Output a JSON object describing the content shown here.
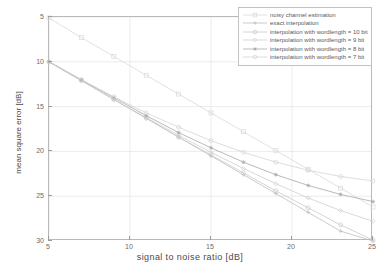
{
  "chart_data": {
    "type": "line",
    "title": "",
    "xlabel": "signal  to  noise ratio [dB]",
    "ylabel": "mean square error [dB]",
    "xlim": [
      5,
      25
    ],
    "ylim": [
      5,
      30
    ],
    "y_inverted": true,
    "grid": true,
    "legend_position": "top-right",
    "xticks": [
      5,
      10,
      15,
      20,
      25
    ],
    "yticks": [
      5,
      10,
      15,
      20,
      25,
      30
    ],
    "x": [
      5,
      7,
      9,
      11,
      13,
      15,
      17,
      19,
      21,
      23,
      25
    ],
    "series": [
      {
        "name": "noisy channel estimation",
        "marker": "square",
        "color": "#d9d9d9",
        "values": [
          5.1,
          7.3,
          9.4,
          11.5,
          13.6,
          15.7,
          17.8,
          19.9,
          22.0,
          24.1,
          26.2
        ]
      },
      {
        "name": "exact interpolation",
        "marker": "plus",
        "color": "#bdbdbd",
        "values": [
          10.0,
          12.1,
          14.2,
          16.3,
          18.4,
          20.5,
          22.6,
          24.7,
          26.8,
          28.9,
          30.0
        ]
      },
      {
        "name": "interpolation with wordlength = 10 bit",
        "marker": "circle",
        "color": "#c9c9c9",
        "values": [
          10.0,
          12.1,
          14.2,
          16.3,
          18.4,
          20.4,
          22.4,
          24.4,
          26.3,
          28.2,
          29.9
        ]
      },
      {
        "name": "interpolation with wordlength = 9 bit",
        "marker": "diamond",
        "color": "#cfcfcf",
        "values": [
          10.0,
          12.1,
          14.2,
          16.2,
          18.2,
          20.1,
          21.9,
          23.6,
          25.2,
          26.6,
          27.8
        ]
      },
      {
        "name": "interpolation with wordlength = 8 bit",
        "marker": "star",
        "color": "#a8a8a8",
        "values": [
          10.0,
          12.0,
          14.0,
          16.0,
          17.9,
          19.6,
          21.2,
          22.6,
          23.8,
          24.8,
          25.6
        ]
      },
      {
        "name": "interpolation with wordlength = 7 bit",
        "marker": "circle-open",
        "color": "#d4d4d4",
        "values": [
          10.0,
          12.0,
          13.9,
          15.7,
          17.3,
          18.8,
          20.1,
          21.2,
          22.1,
          22.8,
          23.3
        ]
      }
    ]
  }
}
